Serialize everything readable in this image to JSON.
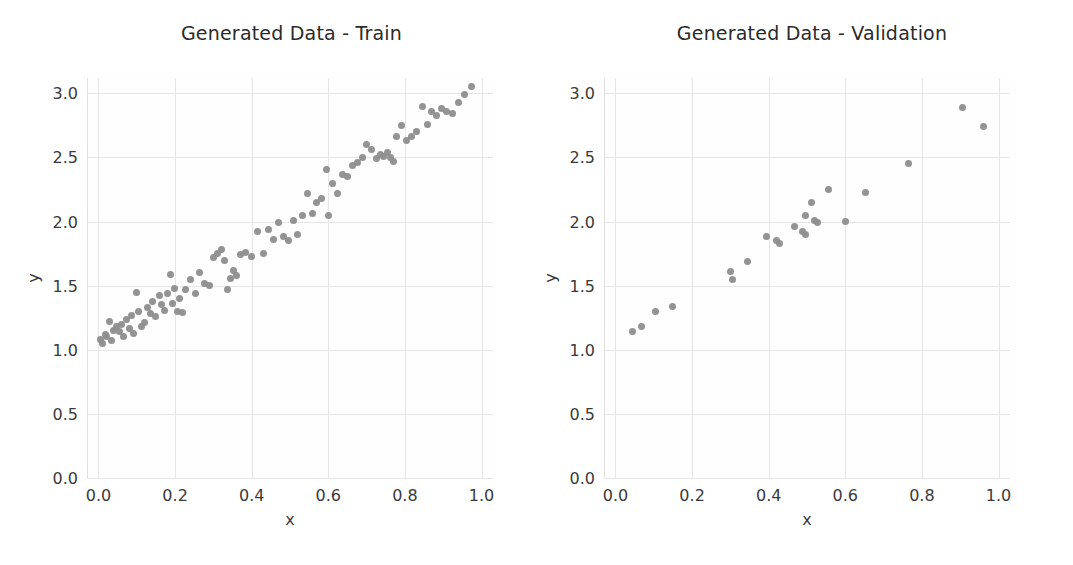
{
  "figure": {
    "background_color": "#ffffff",
    "grid_color": "#e6e6e6",
    "marker_color": "#8d8d8d",
    "text_color": "#3a3a3a"
  },
  "panels": [
    {
      "key": "train",
      "title": "Generated Data - Train"
    },
    {
      "key": "validation",
      "title": "Generated Data - Validation"
    }
  ],
  "axes": {
    "xlabel": "x",
    "ylabel": "y",
    "xlim": [
      -0.03,
      1.03
    ],
    "ylim": [
      0.0,
      3.12
    ],
    "xticks": [
      "0.0",
      "0.2",
      "0.4",
      "0.6",
      "0.8",
      "1.0"
    ],
    "xtick_values": [
      0.0,
      0.2,
      0.4,
      0.6,
      0.8,
      1.0
    ],
    "yticks": [
      "0.0",
      "0.5",
      "1.0",
      "1.5",
      "2.0",
      "2.5",
      "3.0"
    ],
    "ytick_values": [
      0.0,
      0.5,
      1.0,
      1.5,
      2.0,
      2.5,
      3.0
    ],
    "grid": true
  },
  "chart_data": [
    {
      "type": "scatter",
      "title": "Generated Data - Train",
      "xlabel": "x",
      "ylabel": "y",
      "xlim": [
        -0.03,
        1.03
      ],
      "ylim": [
        0.0,
        3.12
      ],
      "grid": true,
      "legend": null,
      "marker_color": "#8d8d8d",
      "n_points": 96,
      "x": [
        0.005,
        0.01,
        0.018,
        0.022,
        0.03,
        0.035,
        0.04,
        0.048,
        0.055,
        0.06,
        0.065,
        0.072,
        0.08,
        0.085,
        0.092,
        0.1,
        0.105,
        0.112,
        0.12,
        0.128,
        0.135,
        0.142,
        0.15,
        0.158,
        0.165,
        0.172,
        0.18,
        0.188,
        0.192,
        0.198,
        0.205,
        0.212,
        0.22,
        0.228,
        0.24,
        0.252,
        0.265,
        0.278,
        0.29,
        0.3,
        0.312,
        0.32,
        0.33,
        0.338,
        0.345,
        0.352,
        0.36,
        0.372,
        0.385,
        0.4,
        0.415,
        0.43,
        0.445,
        0.458,
        0.47,
        0.482,
        0.495,
        0.508,
        0.52,
        0.532,
        0.545,
        0.558,
        0.57,
        0.582,
        0.595,
        0.6,
        0.612,
        0.625,
        0.638,
        0.65,
        0.662,
        0.675,
        0.688,
        0.7,
        0.712,
        0.725,
        0.735,
        0.745,
        0.755,
        0.762,
        0.77,
        0.778,
        0.79,
        0.805,
        0.818,
        0.83,
        0.845,
        0.858,
        0.87,
        0.882,
        0.895,
        0.908,
        0.925,
        0.94,
        0.955,
        0.975
      ],
      "y": [
        1.08,
        1.05,
        1.12,
        1.1,
        1.22,
        1.07,
        1.15,
        1.18,
        1.14,
        1.2,
        1.1,
        1.24,
        1.17,
        1.27,
        1.13,
        1.45,
        1.3,
        1.18,
        1.21,
        1.33,
        1.28,
        1.38,
        1.26,
        1.42,
        1.35,
        1.31,
        1.44,
        1.59,
        1.36,
        1.48,
        1.3,
        1.4,
        1.29,
        1.47,
        1.55,
        1.44,
        1.6,
        1.52,
        1.5,
        1.72,
        1.75,
        1.78,
        1.7,
        1.47,
        1.56,
        1.62,
        1.58,
        1.74,
        1.76,
        1.73,
        1.92,
        1.75,
        1.94,
        1.86,
        1.99,
        1.88,
        1.85,
        2.01,
        1.9,
        2.05,
        2.22,
        2.06,
        2.15,
        2.18,
        2.41,
        2.05,
        2.3,
        2.22,
        2.37,
        2.35,
        2.44,
        2.46,
        2.5,
        2.6,
        2.56,
        2.49,
        2.52,
        2.51,
        2.54,
        2.5,
        2.47,
        2.66,
        2.75,
        2.63,
        2.66,
        2.7,
        2.9,
        2.76,
        2.86,
        2.83,
        2.88,
        2.86,
        2.84,
        2.93,
        2.99,
        3.05
      ]
    },
    {
      "type": "scatter",
      "title": "Generated Data - Validation",
      "xlabel": "x",
      "ylabel": "y",
      "xlim": [
        -0.03,
        1.03
      ],
      "ylim": [
        0.0,
        3.12
      ],
      "grid": true,
      "legend": null,
      "marker_color": "#8d8d8d",
      "n_points": 22,
      "x": [
        0.045,
        0.068,
        0.105,
        0.148,
        0.3,
        0.305,
        0.345,
        0.395,
        0.42,
        0.428,
        0.468,
        0.488,
        0.495,
        0.497,
        0.513,
        0.52,
        0.528,
        0.555,
        0.6,
        0.652,
        0.765,
        0.905,
        0.962
      ],
      "y": [
        1.14,
        1.18,
        1.3,
        1.34,
        1.61,
        1.55,
        1.69,
        1.88,
        1.85,
        1.83,
        1.96,
        1.92,
        2.05,
        1.9,
        2.15,
        2.01,
        1.99,
        2.25,
        2.0,
        2.23,
        2.45,
        2.89,
        2.74
      ]
    }
  ]
}
